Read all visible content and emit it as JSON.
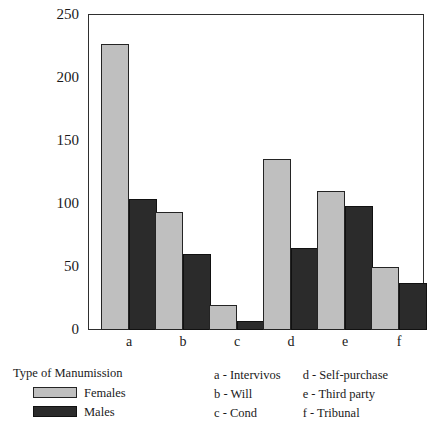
{
  "chart_data": {
    "type": "bar",
    "title": "",
    "xlabel": "Type of Manumission",
    "ylabel": "",
    "categories": [
      "a",
      "b",
      "c",
      "d",
      "e",
      "f"
    ],
    "category_names": [
      "Intervivos",
      "Will",
      "Cond",
      "Self-purchase",
      "Third party",
      "Tribunal"
    ],
    "series": [
      {
        "name": "Females",
        "color": "#bfbfbf",
        "values": [
          226,
          93,
          20,
          135,
          110,
          50
        ]
      },
      {
        "name": "Males",
        "color": "#2b2b2b",
        "values": [
          104,
          60,
          7,
          65,
          98,
          37
        ]
      }
    ],
    "ylim": [
      0,
      250
    ],
    "yticks": [
      0,
      50,
      100,
      150,
      200,
      250
    ],
    "ytick_labels": [
      "0",
      "50",
      "100",
      "150",
      "200",
      "250"
    ],
    "grid": false,
    "legend_position": "below-left"
  },
  "axes": {
    "y_tick_labels": [
      "250",
      "200",
      "150",
      "100",
      "50",
      "0"
    ],
    "x_tick_labels": [
      "a",
      "b",
      "c",
      "d",
      "e",
      "f"
    ]
  },
  "legend": {
    "title": "Type of Manumission",
    "entries": [
      {
        "label": "Females",
        "swatch": "females-swatch"
      },
      {
        "label": "Males",
        "swatch": "males-swatch"
      }
    ]
  },
  "key": {
    "column_left": [
      "a - Intervivos",
      "b - Will",
      "c - Cond"
    ],
    "column_right": [
      "d - Self-purchase",
      "e - Third party",
      "f - Tribunal"
    ]
  },
  "colors": {
    "females": "#bfbfbf",
    "males": "#2b2b2b",
    "frame": "#2f2f2f",
    "background": "#ffffff"
  }
}
